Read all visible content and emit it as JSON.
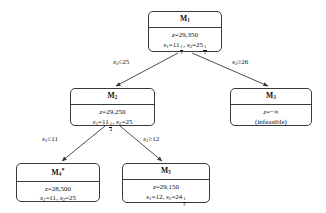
{
  "diagram": {
    "type": "branch-and-bound-tree",
    "background_color": "#ffffff",
    "line_color": "#3a3a3a",
    "text_color": "#111111"
  },
  "nodes": {
    "m1": {
      "title": "M",
      "index": "1",
      "z_label": "z",
      "z_value": "=29,350",
      "x1_label": "x",
      "x1_sub": "1",
      "x1_eq": "=11",
      "x1_frac_num": "1",
      "x1_frac_den": "2",
      "sep": ",",
      "x2_label": "x",
      "x2_sub": "2",
      "x2_eq": "=25",
      "x2_frac_num": "1",
      "x2_frac_den": "2"
    },
    "m2": {
      "title": "M",
      "index": "2",
      "z_label": "z",
      "z_value": "=29,250",
      "x1_label": "x",
      "x1_sub": "1",
      "x1_eq": "=11",
      "x1_frac_num": "1",
      "x1_frac_den": "4",
      "sep": ",",
      "x2_label": "x",
      "x2_sub": "2",
      "x2_eq": "=25"
    },
    "m3": {
      "title": "M",
      "index": "3",
      "z_label": "z",
      "z_value": "=−∞",
      "status": "(infeasible)"
    },
    "m4": {
      "title": "M",
      "index": "4",
      "star": "*",
      "z_label": "z",
      "z_value": "=28,500",
      "x1_label": "x",
      "x1_sub": "1",
      "x1_eq": "=11",
      "sep": ",",
      "x2_label": "x",
      "x2_sub": "2",
      "x2_eq": "=25"
    },
    "m5": {
      "title": "M",
      "index": "5",
      "z_label": "z",
      "z_value": "=29,150",
      "x1_label": "x",
      "x1_sub": "1",
      "x1_eq": "=12",
      "sep": ",",
      "x2_label": "x",
      "x2_sub": "2",
      "x2_eq": "=24",
      "x2_frac_num": "1",
      "x2_frac_den": "2"
    }
  },
  "edges": {
    "m1_to_m2": {
      "var": "x",
      "sub": "2",
      "rel": "≤25"
    },
    "m1_to_m3": {
      "var": "x",
      "sub": "2",
      "rel": "≥26"
    },
    "m2_to_m4": {
      "var": "x",
      "sub": "1",
      "rel": "≤11"
    },
    "m2_to_m5": {
      "var": "x",
      "sub": "1",
      "rel": "≥12"
    }
  }
}
